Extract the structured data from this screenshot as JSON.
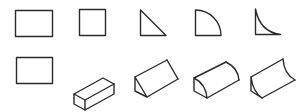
{
  "diagram": {
    "colors": {
      "stroke": "#2a2a2a",
      "background": "#ffffff"
    },
    "top_row": [
      {
        "id": "rectangle",
        "label": "rectangle-profile"
      },
      {
        "id": "square",
        "label": "square-profile"
      },
      {
        "id": "right-triangle",
        "label": "right-triangle-profile"
      },
      {
        "id": "quarter-circle",
        "label": "quarter-circle-profile"
      },
      {
        "id": "concave-fillet",
        "label": "concave-fillet-profile"
      }
    ],
    "bottom_row": [
      {
        "id": "rectangle",
        "label": "rectangle-flat"
      },
      {
        "id": "rectangular-prism",
        "label": "rectangular-box-solid"
      },
      {
        "id": "triangular-prism",
        "label": "triangular-prism-solid"
      },
      {
        "id": "quarter-cylinder",
        "label": "quarter-cylinder-solid"
      },
      {
        "id": "concave-prism",
        "label": "concave-fillet-solid"
      }
    ]
  }
}
